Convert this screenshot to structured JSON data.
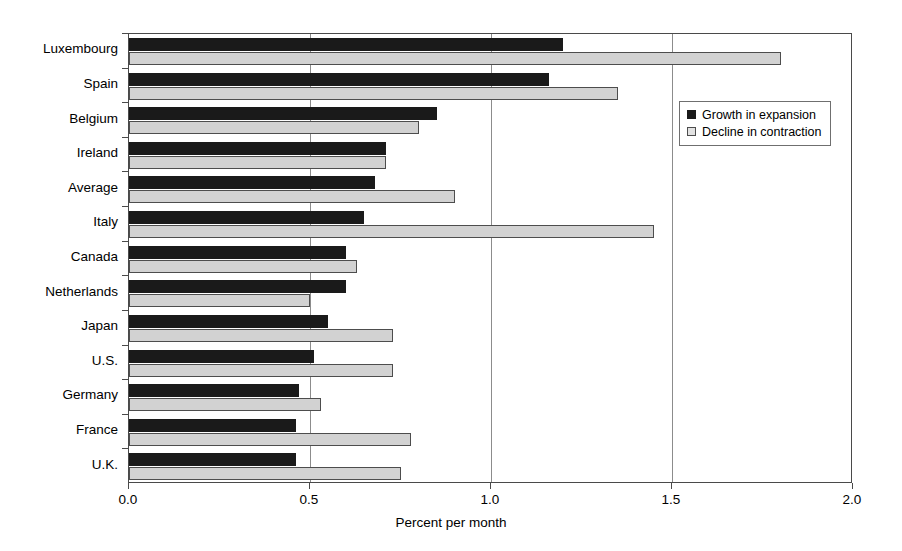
{
  "chart_data": {
    "type": "bar",
    "orientation": "horizontal",
    "title": "",
    "xlabel": "Percent per month",
    "ylabel": "",
    "xlim": [
      0.0,
      2.0
    ],
    "xticks": [
      "0.0",
      "0.5",
      "1.0",
      "1.5",
      "2.0"
    ],
    "xtick_values": [
      0.0,
      0.5,
      1.0,
      1.5,
      2.0
    ],
    "grid": "vertical",
    "legend_position": "upper right inside",
    "categories": [
      "Luxembourg",
      "Spain",
      "Belgium",
      "Ireland",
      "Average",
      "Italy",
      "Canada",
      "Netherlands",
      "Japan",
      "U.S.",
      "Germany",
      "France",
      "U.K."
    ],
    "series": [
      {
        "name": "Growth in expansion",
        "color": "#1a1a1a",
        "values": [
          1.2,
          1.16,
          0.85,
          0.71,
          0.68,
          0.65,
          0.6,
          0.6,
          0.55,
          0.51,
          0.47,
          0.46,
          0.46
        ]
      },
      {
        "name": "Decline in contraction",
        "color": "#d2d2d2",
        "values": [
          1.8,
          1.35,
          0.8,
          0.71,
          0.9,
          1.45,
          0.63,
          0.5,
          0.73,
          0.73,
          0.53,
          0.78,
          0.75
        ]
      }
    ]
  },
  "legend": {
    "items": [
      {
        "label": "Growth in expansion",
        "swatch": "dark"
      },
      {
        "label": "Decline in contraction",
        "swatch": "light"
      }
    ]
  },
  "axis": {
    "x_title": "Percent per month"
  }
}
